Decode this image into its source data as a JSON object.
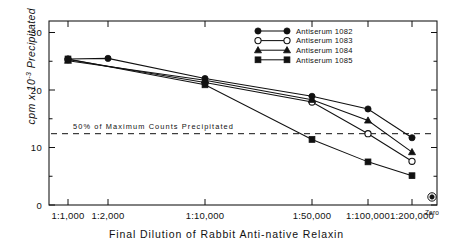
{
  "chart_data": {
    "type": "line",
    "title": "",
    "xlabel": "Final Dilution of Rabbit Anti-native Relaxin",
    "ylabel": "cpm x 10-3 Precipitated",
    "ylabel_prefix": "cpm x 10",
    "ylabel_exponent": "-3",
    "ylabel_suffix": " Precipitated",
    "categories": [
      "1:1,000",
      "1:2,000",
      "1:10,000",
      "1:50,000",
      "1:100,000",
      "1:200,000",
      "Zero"
    ],
    "yticks": [
      "0",
      "10",
      "20",
      "30"
    ],
    "ytick_values": [
      0,
      10,
      20,
      30
    ],
    "ylim": [
      0,
      32
    ],
    "grid": false,
    "legend_position": "top-right",
    "series": [
      {
        "name": "Antiserum 1082",
        "marker": "filled-circle",
        "x": [
          "1:1,000",
          "1:2,000",
          "1:10,000",
          "1:50,000",
          "1:100,000",
          "1:200,000"
        ],
        "values": [
          25.4,
          25.5,
          22.0,
          18.9,
          16.7,
          11.7
        ]
      },
      {
        "name": "Antiserum 1083",
        "marker": "open-circle",
        "x": [
          "1:1,000",
          "1:10,000",
          "1:50,000",
          "1:100,000",
          "1:200,000"
        ],
        "values": [
          25.3,
          21.3,
          17.9,
          12.4,
          7.6
        ]
      },
      {
        "name": "Antiserum 1084",
        "marker": "filled-triangle",
        "x": [
          "1:1,000",
          "1:10,000",
          "1:50,000",
          "1:100,000",
          "1:200,000"
        ],
        "values": [
          25.1,
          21.7,
          18.3,
          14.7,
          9.2
        ]
      },
      {
        "name": "Antiserum 1085",
        "marker": "filled-square",
        "x": [
          "1:1,000",
          "1:10,000",
          "1:50,000",
          "1:100,000",
          "1:200,000"
        ],
        "values": [
          25.4,
          20.9,
          11.4,
          7.5,
          5.1
        ]
      }
    ],
    "extra_points": [
      {
        "name": "Zero",
        "label": "Zero",
        "marker": "circled-dot",
        "x": "Zero",
        "value": 1.4
      }
    ],
    "annotations": [
      {
        "name": "fifty-percent-reference-line",
        "text": "50% of Maximum Counts Precipitated",
        "value": 12.4,
        "style": "dashed-horizontal"
      }
    ]
  },
  "legend": {
    "items": [
      {
        "label": "Antiserum 1082",
        "marker": "filled-circle"
      },
      {
        "label": "Antiserum 1083",
        "marker": "open-circle"
      },
      {
        "label": "Antiserum 1084",
        "marker": "filled-triangle"
      },
      {
        "label": "Antiserum 1085",
        "marker": "filled-square"
      }
    ]
  },
  "colors": {
    "ink": "#111111",
    "background": "#ffffff"
  }
}
